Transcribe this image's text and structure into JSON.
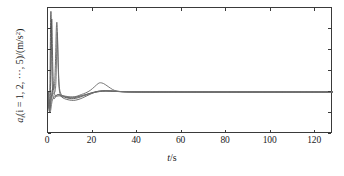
{
  "chart_data": {
    "type": "line",
    "title": "",
    "xlabel": "t/s",
    "ylabel": "a_i (i=1, 2, ..., 5)/(m/s^2)",
    "xlim": [
      0,
      128
    ],
    "ylim": [
      -100,
      200
    ],
    "xticks": [
      0,
      20,
      40,
      60,
      80,
      100,
      120
    ],
    "yticks": [
      -100,
      -50,
      0,
      50,
      100,
      150,
      200
    ],
    "xtick_labels": [
      "0",
      "20",
      "40",
      "60",
      "80",
      "100",
      "120"
    ],
    "ytick_labels": [
      "−100",
      "−50",
      "0",
      "50",
      "100",
      "150",
      "200"
    ],
    "grid": false,
    "legend": "none",
    "line_color": "#585858",
    "frame_color": "#3a3a3a",
    "series": [
      {
        "name": "a1",
        "color": "#4f4f4f",
        "points": [
          [
            0,
            0
          ],
          [
            0.2,
            -18
          ],
          [
            0.45,
            -38
          ],
          [
            0.7,
            -30
          ],
          [
            0.9,
            20
          ],
          [
            1.05,
            110
          ],
          [
            1.2,
            178
          ],
          [
            1.35,
            190
          ],
          [
            1.5,
            150
          ],
          [
            1.7,
            80
          ],
          [
            1.9,
            26
          ],
          [
            2.1,
            -2
          ],
          [
            2.4,
            -14
          ],
          [
            2.8,
            -16
          ],
          [
            3.3,
            -12
          ],
          [
            3.8,
            -8
          ],
          [
            4.5,
            -6
          ],
          [
            5.5,
            -7
          ],
          [
            7,
            -10
          ],
          [
            9,
            -13
          ],
          [
            11,
            -14
          ],
          [
            13,
            -12
          ],
          [
            15,
            -9
          ],
          [
            17,
            -6
          ],
          [
            19,
            -3
          ],
          [
            21,
            0
          ],
          [
            23,
            2
          ],
          [
            26,
            3
          ],
          [
            29,
            2
          ],
          [
            32,
            1
          ],
          [
            36,
            0.4
          ],
          [
            42,
            0
          ],
          [
            50,
            0
          ],
          [
            60,
            0
          ],
          [
            80,
            0
          ],
          [
            100,
            0
          ],
          [
            128,
            0
          ]
        ]
      },
      {
        "name": "a2",
        "color": "#565656",
        "points": [
          [
            0,
            0
          ],
          [
            0.2,
            -14
          ],
          [
            0.5,
            -42
          ],
          [
            0.8,
            -44
          ],
          [
            1.0,
            -20
          ],
          [
            1.2,
            40
          ],
          [
            1.45,
            130
          ],
          [
            1.65,
            172
          ],
          [
            1.8,
            160
          ],
          [
            2.0,
            100
          ],
          [
            2.2,
            48
          ],
          [
            2.5,
            12
          ],
          [
            2.9,
            -4
          ],
          [
            3.4,
            -9
          ],
          [
            4.0,
            -10
          ],
          [
            5.0,
            -9
          ],
          [
            6.5,
            -11
          ],
          [
            8.5,
            -14
          ],
          [
            10.5,
            -16
          ],
          [
            12.5,
            -15
          ],
          [
            14.5,
            -12
          ],
          [
            16.5,
            -8
          ],
          [
            18.5,
            -4
          ],
          [
            20.5,
            -1
          ],
          [
            23,
            1
          ],
          [
            26,
            2
          ],
          [
            30,
            1.5
          ],
          [
            34,
            0.6
          ],
          [
            40,
            0.1
          ],
          [
            50,
            0
          ],
          [
            70,
            0
          ],
          [
            100,
            0
          ],
          [
            128,
            0
          ]
        ]
      },
      {
        "name": "a3",
        "color": "#5e5e5e",
        "points": [
          [
            0,
            0
          ],
          [
            0.3,
            -22
          ],
          [
            0.6,
            -46
          ],
          [
            1.0,
            -40
          ],
          [
            1.4,
            -18
          ],
          [
            1.8,
            2
          ],
          [
            2.2,
            8
          ],
          [
            2.6,
            6
          ],
          [
            3.0,
            20
          ],
          [
            3.4,
            80
          ],
          [
            3.7,
            145
          ],
          [
            3.95,
            166
          ],
          [
            4.15,
            150
          ],
          [
            4.4,
            95
          ],
          [
            4.7,
            42
          ],
          [
            5.0,
            10
          ],
          [
            5.5,
            -6
          ],
          [
            6.2,
            -12
          ],
          [
            7.5,
            -16
          ],
          [
            9.5,
            -19
          ],
          [
            11.5,
            -20
          ],
          [
            13.5,
            -18
          ],
          [
            15.5,
            -14
          ],
          [
            17.5,
            -9
          ],
          [
            19.5,
            -4
          ],
          [
            21.5,
            0
          ],
          [
            23,
            2
          ],
          [
            26,
            3
          ],
          [
            30,
            2
          ],
          [
            34,
            0.8
          ],
          [
            40,
            0.2
          ],
          [
            55,
            0
          ],
          [
            80,
            0
          ],
          [
            128,
            0
          ]
        ]
      },
      {
        "name": "a4",
        "color": "#6a6a6a",
        "points": [
          [
            0,
            0
          ],
          [
            0.3,
            -16
          ],
          [
            0.7,
            -34
          ],
          [
            1.1,
            -30
          ],
          [
            1.5,
            -16
          ],
          [
            2.0,
            -6
          ],
          [
            2.6,
            -2
          ],
          [
            3.2,
            2
          ],
          [
            3.6,
            30
          ],
          [
            3.9,
            100
          ],
          [
            4.1,
            140
          ],
          [
            4.3,
            128
          ],
          [
            4.6,
            70
          ],
          [
            4.9,
            26
          ],
          [
            5.3,
            4
          ],
          [
            6.0,
            -6
          ],
          [
            7.0,
            -10
          ],
          [
            9,
            -12
          ],
          [
            11,
            -12
          ],
          [
            13,
            -10
          ],
          [
            15,
            -6
          ],
          [
            17,
            -2
          ],
          [
            19,
            4
          ],
          [
            21,
            13
          ],
          [
            22.5,
            20
          ],
          [
            23.5,
            22
          ],
          [
            25,
            20
          ],
          [
            27,
            13
          ],
          [
            29,
            6
          ],
          [
            31,
            2
          ],
          [
            34,
            0.5
          ],
          [
            38,
            0
          ],
          [
            50,
            0
          ],
          [
            80,
            0
          ],
          [
            128,
            0
          ]
        ]
      },
      {
        "name": "a5",
        "color": "#747474",
        "points": [
          [
            0,
            0
          ],
          [
            0.4,
            -26
          ],
          [
            0.8,
            -48
          ],
          [
            1.2,
            -44
          ],
          [
            1.7,
            -26
          ],
          [
            2.3,
            -14
          ],
          [
            3.0,
            -10
          ],
          [
            3.8,
            -8
          ],
          [
            4.6,
            -6
          ],
          [
            5.5,
            -7
          ],
          [
            7,
            -9
          ],
          [
            9,
            -11
          ],
          [
            11,
            -12
          ],
          [
            13,
            -11
          ],
          [
            15,
            -9
          ],
          [
            17,
            -7
          ],
          [
            19,
            -4
          ],
          [
            21,
            -1
          ],
          [
            24,
            2
          ],
          [
            27,
            3
          ],
          [
            30,
            2
          ],
          [
            33,
            1
          ],
          [
            37,
            0.3
          ],
          [
            45,
            0
          ],
          [
            60,
            0
          ],
          [
            90,
            0
          ],
          [
            128,
            0
          ]
        ]
      }
    ]
  },
  "axes": {
    "x_title_var": "t",
    "x_title_unit": "/s",
    "y_title_main": "a",
    "y_title_sub": "i",
    "y_title_paren": "(i = 1, 2, ···, 5)/(m/s",
    "y_title_sup": "2",
    "y_title_close": ")"
  }
}
